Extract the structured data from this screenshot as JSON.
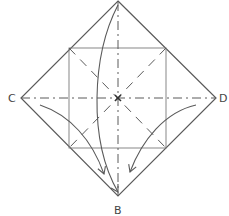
{
  "diagram": {
    "type": "origami-fold-instruction",
    "colors": {
      "line": "#5a5a5a",
      "background": "#ffffff"
    },
    "vertices": {
      "top": {
        "x": 118,
        "y": 1
      },
      "left": {
        "label": "C",
        "x": 21,
        "y": 98
      },
      "right": {
        "label": "D",
        "x": 216,
        "y": 98
      },
      "bottom": {
        "label": "B",
        "x": 118,
        "y": 196
      }
    },
    "labels": {
      "c": "C",
      "d": "D",
      "b": "B"
    },
    "inner_square": {
      "x": 69,
      "y": 48,
      "width": 97,
      "height": 100
    },
    "fold_lines": {
      "horizontal": "dash-dot (mountain fold) from C to D",
      "vertical": "dash-dot (mountain fold) from top to B",
      "diagonals": "dashed (valley folds) inside inner square"
    },
    "arrows": [
      {
        "name": "top-to-b-arrow",
        "from": "top",
        "to": "B"
      },
      {
        "name": "c-to-b-arrow",
        "from": "C",
        "to": "B"
      },
      {
        "name": "d-to-b-arrow",
        "from": "D",
        "to": "B"
      }
    ]
  }
}
